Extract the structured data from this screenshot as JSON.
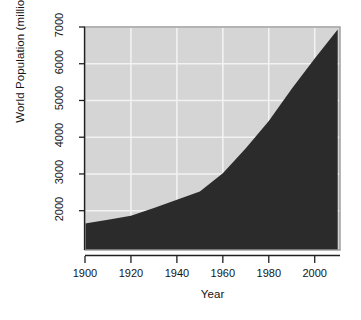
{
  "chart_data": {
    "type": "area",
    "title": "",
    "xlabel": "Year",
    "ylabel": "World Population (millions)",
    "xlim": [
      1900,
      2011
    ],
    "ylim": [
      930,
      7000
    ],
    "xticks": [
      1900,
      1920,
      1940,
      1960,
      1980,
      2000
    ],
    "xtick_labels": [
      "1900",
      "1920",
      "1940",
      "1960",
      "1980",
      "2000"
    ],
    "yticks": [
      2000,
      3000,
      4000,
      5000,
      6000,
      7000
    ],
    "ytick_labels": [
      "2000",
      "3000",
      "4000",
      "5000",
      "6000",
      "7000"
    ],
    "grid": true,
    "legend": "none",
    "x": [
      1900,
      1910,
      1920,
      1930,
      1940,
      1950,
      1960,
      1970,
      1980,
      1990,
      2000,
      2010
    ],
    "values": [
      1650,
      1750,
      1860,
      2070,
      2300,
      2520,
      3020,
      3700,
      4440,
      5320,
      6140,
      6930
    ],
    "series": [
      {
        "name": "World Population (millions)",
        "values": [
          1650,
          1750,
          1860,
          2070,
          2300,
          2520,
          3020,
          3700,
          4440,
          5320,
          6140,
          6930
        ]
      }
    ],
    "colors": {
      "plot_background": "#d5d5d5",
      "area_fill": "#2b2b2b",
      "gridline": "#f2f2f2",
      "axis": "#202020",
      "page_background": "#ffffff",
      "text": "#141414"
    }
  },
  "figure": {
    "y_axis_title": "World Population (millions)",
    "x_axis_title": "Year"
  }
}
